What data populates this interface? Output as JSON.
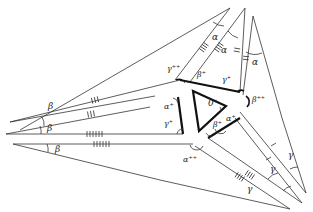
{
  "figure": {
    "colors": {
      "line": "#333333",
      "thick_line": "#111111",
      "background": "#ffffff"
    }
  },
  "labels": {
    "center": "0⁺",
    "alpha_top_1": "α",
    "alpha_top_2": "α",
    "alpha_top_3": "α",
    "beta_left_1": "β",
    "beta_left_2": "β",
    "beta_left_3": "β",
    "gamma_right_1": "γ",
    "gamma_right_2": "γ",
    "gamma_right_3": "γ",
    "gamma_pp": "γ⁺⁺",
    "beta_pp": "β⁺⁺",
    "alpha_pp": "α⁺⁺",
    "beta_p_top": "β⁺",
    "gamma_p_top": "γ⁺",
    "alpha_p_left": "α⁺",
    "gamma_p_left": "γ⁺",
    "beta_p_bottom": "β⁺",
    "alpha_p_bottom": "α⁺"
  },
  "tick_groups": {
    "upper_pair_ticks": 4,
    "upper_right_ticks": 2,
    "left_upper_ticks": 3,
    "left_lower_ticks": 6,
    "lower_right_ticks": 4,
    "right_single_ticks": 1
  }
}
